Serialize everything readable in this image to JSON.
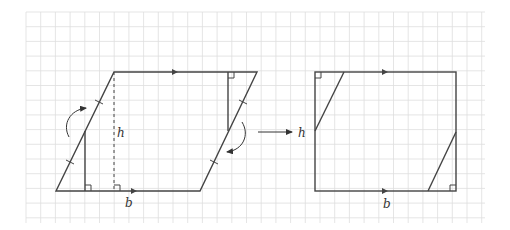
{
  "figure": {
    "grid": {
      "x0": 26,
      "y0": 12,
      "x1": 485,
      "y1": 223,
      "spacing": 14.7,
      "color": "#dcdcdc"
    },
    "stroke_color": "#444444",
    "parallelogram": {
      "points": [
        [
          56,
          191
        ],
        [
          200,
          191
        ],
        [
          257,
          72
        ],
        [
          114,
          72
        ]
      ],
      "height_label": "h",
      "base_label": "b",
      "height_label_pos": [
        117,
        137
      ],
      "base_label_pos": [
        125,
        207
      ],
      "dashed_height": {
        "x": 114,
        "y1": 72,
        "y2": 191
      },
      "inner_left": {
        "x": 85,
        "y1": 131,
        "y2": 191
      },
      "inner_right": {
        "x": 228,
        "y1": 72,
        "y2": 131
      }
    },
    "rectangle": {
      "x": 315,
      "y": 72,
      "w": 141,
      "h": 119,
      "height_label": "h",
      "base_label": "b",
      "height_label_pos": [
        298,
        137
      ],
      "base_label_pos": [
        383,
        208
      ],
      "cut_top": [
        [
          344,
          72
        ],
        [
          315,
          131
        ]
      ],
      "cut_bottom": [
        [
          456,
          132
        ],
        [
          428,
          191
        ]
      ]
    },
    "transform_arrow": {
      "from": [
        258,
        132
      ],
      "to": [
        292,
        132
      ]
    },
    "labels": {
      "parallelogram_h": "h",
      "parallelogram_b": "b",
      "rectangle_h": "h",
      "rectangle_b": "b"
    }
  }
}
